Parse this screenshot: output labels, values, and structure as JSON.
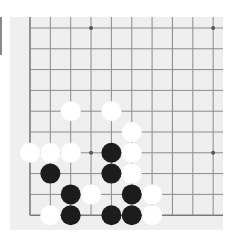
{
  "board": {
    "description": "Lower-left corner of a Go board (partial view)",
    "columns_visible": 10,
    "rows_visible": 10,
    "edges": [
      "left",
      "bottom"
    ],
    "grid_origin_px": [
      30,
      28
    ],
    "cell_width_px": 20.35,
    "cell_height_px": 20.8,
    "stone_radius_px": 10,
    "colors": {
      "background": "#efefef",
      "grid_line": "#8c8c8c",
      "edge_line": "#7a7a7a",
      "star_point": "#555555",
      "black_stone": "#1c1c1c",
      "white_stone": "#ffffff"
    },
    "star_points": [
      {
        "col": 3,
        "row": 0
      },
      {
        "col": 9,
        "row": 0
      },
      {
        "col": 3,
        "row": 6
      },
      {
        "col": 9,
        "row": 6
      }
    ],
    "stones": [
      {
        "col": 2,
        "row": 4,
        "color": "white"
      },
      {
        "col": 4,
        "row": 4,
        "color": "white"
      },
      {
        "col": 5,
        "row": 5,
        "color": "white"
      },
      {
        "col": 0,
        "row": 6,
        "color": "white"
      },
      {
        "col": 1,
        "row": 6,
        "color": "white"
      },
      {
        "col": 2,
        "row": 6,
        "color": "white"
      },
      {
        "col": 4,
        "row": 6,
        "color": "black"
      },
      {
        "col": 5,
        "row": 6,
        "color": "white"
      },
      {
        "col": 1,
        "row": 7,
        "color": "black"
      },
      {
        "col": 4,
        "row": 7,
        "color": "black"
      },
      {
        "col": 5,
        "row": 7,
        "color": "white"
      },
      {
        "col": 2,
        "row": 8,
        "color": "black"
      },
      {
        "col": 3,
        "row": 8,
        "color": "white"
      },
      {
        "col": 5,
        "row": 8,
        "color": "black"
      },
      {
        "col": 6,
        "row": 8,
        "color": "white"
      },
      {
        "col": 1,
        "row": 9,
        "color": "white"
      },
      {
        "col": 2,
        "row": 9,
        "color": "black"
      },
      {
        "col": 4,
        "row": 9,
        "color": "black"
      },
      {
        "col": 5,
        "row": 9,
        "color": "black"
      },
      {
        "col": 6,
        "row": 9,
        "color": "white"
      }
    ]
  }
}
